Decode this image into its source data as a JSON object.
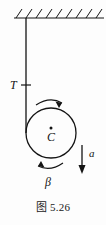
{
  "figure": {
    "caption": "图 5.26",
    "caption_number": "5.26",
    "labels": {
      "tension": "T",
      "center": "C",
      "angular": "β",
      "acceleration": "a"
    },
    "icons": {
      "ceiling": "hatched-ceiling-icon",
      "rope": "rope-line-icon",
      "disk": "circle-disk-icon",
      "center_dot": "center-point-icon",
      "spin_top": "clockwise-arc-arrow-icon",
      "spin_bottom": "clockwise-arc-arrow-icon",
      "accel": "down-arrow-icon",
      "tension_tick": "tick-mark-icon"
    },
    "geometry": {
      "ceiling_y": 18,
      "ceiling_x_start": 14,
      "ceiling_x_end": 104,
      "hatch_count": 9,
      "rope_x": 26,
      "rope_y_top": 18,
      "rope_y_bottom": 133,
      "tension_tick_y": 85,
      "circle_cx": 51,
      "circle_cy": 133,
      "circle_r": 25,
      "accel_arrow_x": 82,
      "accel_arrow_y_top": 145,
      "accel_arrow_y_bottom": 173
    },
    "colors": {
      "ink": "#141414",
      "background": "#fdfdfd"
    }
  }
}
